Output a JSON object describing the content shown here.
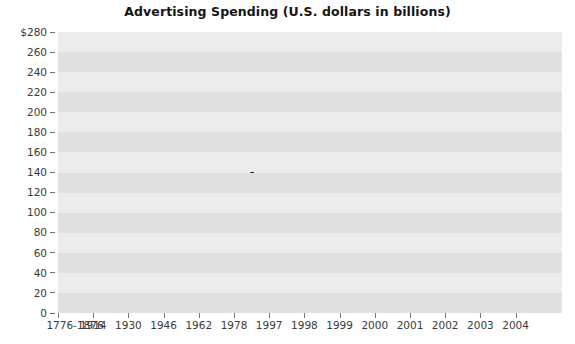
{
  "chart_data": {
    "type": "line",
    "title": "Advertising Spending (U.S. dollars in billions)",
    "xlabel": "",
    "ylabel": "",
    "categories": [
      "1776-1876",
      "1914",
      "1930",
      "1946",
      "1962",
      "1978",
      "1997",
      "1998",
      "1999",
      "2000",
      "2001",
      "2002",
      "2003",
      "2004"
    ],
    "values": [
      2,
      20,
      15,
      27,
      55,
      89,
      188,
      222,
      232,
      236,
      236,
      235,
      252,
      258
    ],
    "series": [
      {
        "name": "Advertising Spending",
        "values": [
          2,
          20,
          15,
          27,
          55,
          89,
          188,
          222,
          232,
          236,
          236,
          235,
          252,
          258
        ]
      }
    ],
    "ylim": [
      0,
      280
    ],
    "ytick_values": [
      280,
      260,
      240,
      220,
      200,
      180,
      160,
      140,
      120,
      100,
      80,
      60,
      40,
      20,
      0
    ],
    "ytick_labels": [
      "$280",
      "260",
      "240",
      "220",
      "200",
      "180",
      "160",
      "140",
      "120",
      "100",
      "80",
      "60",
      "40",
      "20",
      "0"
    ],
    "grid": false,
    "banded_background": true,
    "legend": null,
    "legend_position": "none",
    "line_color": "#1a1a1a",
    "line_width": 3.2,
    "plot_bg_light": "#ececec",
    "plot_bg_dark": "#e0e0e0",
    "axis_text_color": "#3a3a3a",
    "title_color": "#141414"
  }
}
